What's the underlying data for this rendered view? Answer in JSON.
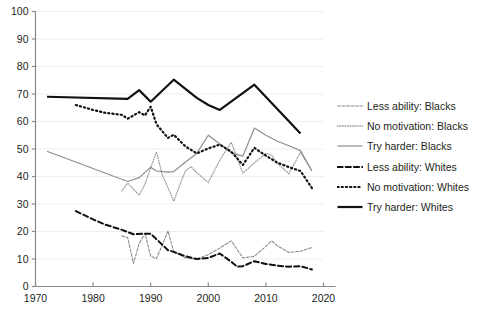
{
  "chart_data": {
    "type": "line",
    "title": "",
    "subtitle": "",
    "xlabel": "",
    "ylabel": "",
    "xlim": [
      1970,
      2020
    ],
    "ylim": [
      0,
      100
    ],
    "grid": "horizontal",
    "legend_position": "right",
    "x_ticks": [
      1970,
      1980,
      1990,
      2000,
      2010,
      2020
    ],
    "y_ticks": [
      0,
      10,
      20,
      30,
      40,
      50,
      60,
      70,
      80,
      90,
      100
    ],
    "series": [
      {
        "name": "Less ability: Blacks",
        "color": "#8c8c8c",
        "style": "dashed",
        "width": 1.1,
        "points": [
          [
            1985,
            18.4
          ],
          [
            1986,
            17.8
          ],
          [
            1987,
            8.4
          ],
          [
            1988,
            15.6
          ],
          [
            1989,
            19.4
          ],
          [
            1990,
            11.0
          ],
          [
            1991,
            10.2
          ],
          [
            1992,
            15.0
          ],
          [
            1993,
            20.2
          ],
          [
            1994,
            12.6
          ],
          [
            1995,
            11.6
          ],
          [
            1996,
            10.4
          ],
          [
            1997,
            10.2
          ],
          [
            1998,
            10.0
          ],
          [
            2000,
            11.6
          ],
          [
            2002,
            14.0
          ],
          [
            2004,
            16.6
          ],
          [
            2006,
            10.4
          ],
          [
            2008,
            11.0
          ],
          [
            2010,
            14.6
          ],
          [
            2011,
            16.6
          ],
          [
            2012,
            14.8
          ],
          [
            2014,
            12.4
          ],
          [
            2016,
            12.8
          ],
          [
            2018,
            14.2
          ]
        ]
      },
      {
        "name": "No motivation: Blacks",
        "color": "#9b9b9b",
        "style": "dotted",
        "width": 1.3,
        "points": [
          [
            1985,
            34.8
          ],
          [
            1986,
            37.6
          ],
          [
            1987,
            35.4
          ],
          [
            1988,
            33.2
          ],
          [
            1989,
            37.2
          ],
          [
            1990,
            43.2
          ],
          [
            1991,
            49.0
          ],
          [
            1992,
            40.6
          ],
          [
            1993,
            36.0
          ],
          [
            1994,
            31.0
          ],
          [
            1995,
            36.6
          ],
          [
            1996,
            42.0
          ],
          [
            1997,
            43.6
          ],
          [
            1998,
            41.4
          ],
          [
            2000,
            37.8
          ],
          [
            2002,
            46.0
          ],
          [
            2004,
            52.4
          ],
          [
            2006,
            41.2
          ],
          [
            2008,
            45.0
          ],
          [
            2010,
            48.4
          ],
          [
            2011,
            47.8
          ],
          [
            2012,
            44.8
          ],
          [
            2014,
            41.0
          ],
          [
            2016,
            48.8
          ],
          [
            2018,
            42.0
          ]
        ]
      },
      {
        "name": "Try harder: Blacks",
        "color": "#8e8e8e",
        "style": "solid",
        "width": 1.2,
        "points": [
          [
            1972,
            49.2
          ],
          [
            1986,
            38.2
          ],
          [
            1988,
            39.6
          ],
          [
            1990,
            43.4
          ],
          [
            1991,
            42.0
          ],
          [
            1993,
            41.6
          ],
          [
            1994,
            41.8
          ],
          [
            1996,
            45.2
          ],
          [
            1998,
            48.4
          ],
          [
            2000,
            55.0
          ],
          [
            2002,
            51.8
          ],
          [
            2004,
            48.6
          ],
          [
            2006,
            47.4
          ],
          [
            2008,
            57.6
          ],
          [
            2010,
            55.0
          ],
          [
            2012,
            52.8
          ],
          [
            2014,
            51.2
          ],
          [
            2016,
            49.4
          ],
          [
            2018,
            42.0
          ]
        ]
      },
      {
        "name": "Less ability: Whites",
        "color": "#111111",
        "style": "dashed",
        "width": 2.0,
        "points": [
          [
            1977,
            27.4
          ],
          [
            1980,
            24.4
          ],
          [
            1982,
            22.6
          ],
          [
            1985,
            20.6
          ],
          [
            1987,
            19.0
          ],
          [
            1989,
            19.2
          ],
          [
            1990,
            19.2
          ],
          [
            1991,
            17.2
          ],
          [
            1993,
            13.2
          ],
          [
            1994,
            12.6
          ],
          [
            1996,
            11.0
          ],
          [
            1998,
            10.0
          ],
          [
            2000,
            10.4
          ],
          [
            2002,
            12.0
          ],
          [
            2004,
            9.0
          ],
          [
            2005,
            7.2
          ],
          [
            2006,
            7.4
          ],
          [
            2008,
            9.2
          ],
          [
            2010,
            8.2
          ],
          [
            2012,
            7.6
          ],
          [
            2014,
            7.2
          ],
          [
            2016,
            7.4
          ],
          [
            2018,
            6.2
          ]
        ]
      },
      {
        "name": "No motivation: Whites",
        "color": "#111111",
        "style": "dotted",
        "width": 2.2,
        "points": [
          [
            1977,
            66.0
          ],
          [
            1980,
            64.2
          ],
          [
            1982,
            63.2
          ],
          [
            1985,
            62.4
          ],
          [
            1986,
            61.0
          ],
          [
            1988,
            63.4
          ],
          [
            1989,
            62.2
          ],
          [
            1990,
            65.4
          ],
          [
            1991,
            59.0
          ],
          [
            1993,
            54.0
          ],
          [
            1994,
            55.2
          ],
          [
            1996,
            51.0
          ],
          [
            1998,
            48.4
          ],
          [
            2000,
            50.2
          ],
          [
            2002,
            51.6
          ],
          [
            2004,
            49.0
          ],
          [
            2006,
            44.2
          ],
          [
            2008,
            50.4
          ],
          [
            2010,
            47.6
          ],
          [
            2012,
            45.0
          ],
          [
            2014,
            43.4
          ],
          [
            2016,
            42.0
          ],
          [
            2018,
            35.8
          ]
        ]
      },
      {
        "name": "Try harder: Whites",
        "color": "#111111",
        "style": "solid",
        "width": 2.2,
        "points": [
          [
            1972,
            69.0
          ],
          [
            1986,
            68.2
          ],
          [
            1988,
            71.4
          ],
          [
            1990,
            67.2
          ],
          [
            1994,
            75.2
          ],
          [
            1998,
            68.6
          ],
          [
            2000,
            66.0
          ],
          [
            2002,
            64.2
          ],
          [
            2008,
            73.4
          ],
          [
            2016,
            55.6
          ]
        ]
      }
    ]
  },
  "axes": {
    "y_tick_labels": [
      "100",
      "90",
      "80",
      "70",
      "60",
      "50",
      "40",
      "30",
      "20",
      "10",
      "0"
    ],
    "x_tick_labels": [
      "1970",
      "1980",
      "1990",
      "2000",
      "2010",
      "2020"
    ]
  },
  "legend": {
    "items": [
      {
        "label": "Less ability: Blacks",
        "color": "#8c8c8c",
        "style": "dashed",
        "width": 1.1
      },
      {
        "label": "No motivation: Blacks",
        "color": "#9b9b9b",
        "style": "dotted",
        "width": 1.3
      },
      {
        "label": "Try harder: Blacks",
        "color": "#8e8e8e",
        "style": "solid",
        "width": 1.2
      },
      {
        "label": "Less ability: Whites",
        "color": "#111111",
        "style": "dashed",
        "width": 2.0
      },
      {
        "label": "No motivation: Whites",
        "color": "#111111",
        "style": "dotted",
        "width": 2.2
      },
      {
        "label": "Try harder: Whites",
        "color": "#111111",
        "style": "solid",
        "width": 2.2
      }
    ]
  },
  "colors": {
    "background": "#ffffff",
    "axis": "#8a8a8a",
    "gridline": "#eeeeee",
    "text": "#231f20"
  }
}
